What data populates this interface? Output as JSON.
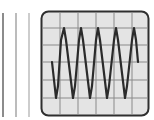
{
  "illustration": {
    "subject": "oscilloscope display with waveform",
    "colors": {
      "background": "#ffffff",
      "screen_fill": "#e4e4e4",
      "screen_border": "#2f2f2f",
      "grid": "#8a8a8a",
      "trace": "#2b2b2b",
      "bar_1": "#8c8c8c",
      "bar_2": "#a6a6a6",
      "bar_3": "#bdbdbd"
    },
    "side_bars": [
      {
        "x": 3,
        "y1": 13,
        "y2": 117
      },
      {
        "x": 16,
        "y1": 13,
        "y2": 117
      },
      {
        "x": 29,
        "y1": 13,
        "y2": 117
      }
    ],
    "screen": {
      "x": 41.5,
      "y": 11.5,
      "width": 107,
      "height": 104,
      "radius": 7
    },
    "grid": {
      "vertical_x": [
        60,
        78,
        96,
        114,
        132
      ],
      "horizontal_y": [
        28,
        45,
        62,
        80,
        98
      ]
    },
    "waveform_points": "52,62 56,98 58,86 61,40 64,28 66,40 73,98 75,86 79,40 81,28 83,40 90,98 92,86 96,40 98,28 100,40 107,98 109,86 114,40 116,28 118,40 125,98 127,86 132,40 134,28 136,40 138,62"
  }
}
